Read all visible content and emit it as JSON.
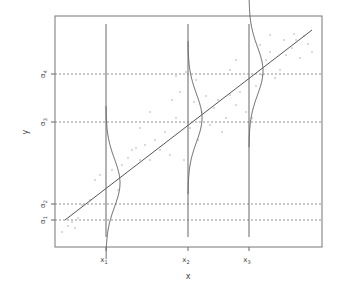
{
  "chart_data": {
    "type": "scatter",
    "title": "",
    "xlabel": "x",
    "ylabel": "y",
    "grid": false,
    "x_ticks": [
      {
        "label": "x1",
        "sub": "1",
        "px": 106
      },
      {
        "label": "x2",
        "sub": "2",
        "px": 188
      },
      {
        "label": "x3",
        "sub": "3",
        "px": 249
      }
    ],
    "y_ticks": [
      {
        "label": "α1",
        "sub": "1",
        "py": 220
      },
      {
        "label": "α2",
        "sub": "2",
        "py": 204
      },
      {
        "label": "α3",
        "sub": "3",
        "py": 122
      },
      {
        "label": "α4",
        "sub": "4",
        "py": 74
      }
    ],
    "threshold_lines": [
      "α1",
      "α2",
      "α3",
      "α4"
    ],
    "regression_line": {
      "x1": 65,
      "y1": 220,
      "x2": 312,
      "y2": 30
    },
    "conditional_densities": [
      {
        "at": "x1",
        "center_py": 183,
        "spread_px": 24,
        "amp_px": 14
      },
      {
        "at": "x2",
        "center_py": 118,
        "spread_px": 24,
        "amp_px": 14
      },
      {
        "at": "x3",
        "center_py": 71,
        "spread_px": 24,
        "amp_px": 14
      }
    ],
    "points": [
      [
        62,
        232
      ],
      [
        68,
        226
      ],
      [
        72,
        222
      ],
      [
        78,
        218
      ],
      [
        75,
        228
      ],
      [
        82,
        205
      ],
      [
        90,
        200
      ],
      [
        95,
        180
      ],
      [
        100,
        175
      ],
      [
        112,
        170
      ],
      [
        118,
        190
      ],
      [
        122,
        165
      ],
      [
        128,
        158
      ],
      [
        132,
        150
      ],
      [
        136,
        148
      ],
      [
        140,
        160
      ],
      [
        145,
        145
      ],
      [
        150,
        160
      ],
      [
        155,
        140
      ],
      [
        160,
        150
      ],
      [
        165,
        132
      ],
      [
        170,
        155
      ],
      [
        172,
        100
      ],
      [
        176,
        118
      ],
      [
        180,
        92
      ],
      [
        184,
        160
      ],
      [
        190,
        128
      ],
      [
        194,
        102
      ],
      [
        198,
        140
      ],
      [
        202,
        112
      ],
      [
        206,
        96
      ],
      [
        210,
        125
      ],
      [
        214,
        108
      ],
      [
        218,
        100
      ],
      [
        222,
        132
      ],
      [
        226,
        118
      ],
      [
        230,
        95
      ],
      [
        236,
        105
      ],
      [
        240,
        92
      ],
      [
        246,
        112
      ],
      [
        252,
        118
      ],
      [
        256,
        86
      ],
      [
        260,
        45
      ],
      [
        262,
        75
      ],
      [
        266,
        60
      ],
      [
        270,
        52
      ],
      [
        275,
        78
      ],
      [
        280,
        70
      ],
      [
        286,
        55
      ],
      [
        292,
        48
      ],
      [
        296,
        40
      ],
      [
        300,
        58
      ],
      [
        304,
        36
      ],
      [
        308,
        44
      ],
      [
        312,
        52
      ],
      [
        176,
        76
      ],
      [
        186,
        72
      ],
      [
        196,
        80
      ],
      [
        230,
        70
      ],
      [
        236,
        60
      ],
      [
        150,
        112
      ],
      [
        140,
        128
      ],
      [
        270,
        35
      ],
      [
        284,
        40
      ],
      [
        294,
        34
      ]
    ]
  },
  "plot_area": {
    "left": 55,
    "top": 16,
    "right": 322,
    "bottom": 247
  }
}
